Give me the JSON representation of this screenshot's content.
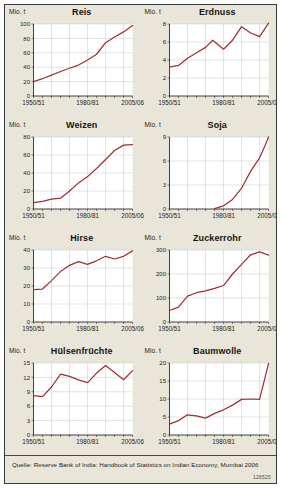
{
  "poster": {
    "unit_label": "Mio. t",
    "source": "Quelle: Reserve Bank of India: Handbook of Statistics on Indian Economy, Mumbai 2006",
    "source_code": "126525",
    "line_color": "#9e2f2f",
    "grid_color": "#b8bfc6",
    "axis_color": "#2b2b28",
    "background_color": "#e9e6d9"
  },
  "chart_data": [
    {
      "type": "line",
      "title": "Reis",
      "ylabel": "Mio. t",
      "xlabel": "",
      "xlim": [
        1950,
        2005
      ],
      "ylim": [
        0,
        100
      ],
      "yticks": [
        0,
        20,
        40,
        60,
        80,
        100
      ],
      "xticks": [
        1950,
        1980,
        2005
      ],
      "xticklabels": [
        "1950/51",
        "1980/81",
        "2005/06"
      ],
      "grid": true,
      "x": [
        1950,
        1955,
        1960,
        1965,
        1970,
        1975,
        1980,
        1985,
        1990,
        1995,
        2000,
        2005
      ],
      "values": [
        20.0,
        24.0,
        29.0,
        34.0,
        38.5,
        43.0,
        50.0,
        58.0,
        74.0,
        82.0,
        89.0,
        98.0
      ]
    },
    {
      "type": "line",
      "title": "Erdnuss",
      "ylabel": "Mio. t",
      "xlabel": "",
      "xlim": [
        1950,
        2005
      ],
      "ylim": [
        0,
        8
      ],
      "yticks": [
        0,
        2,
        4,
        6,
        8
      ],
      "xticks": [
        1950,
        1980,
        2005
      ],
      "xticklabels": [
        "1950/51",
        "1980/81",
        "2005/06"
      ],
      "grid": true,
      "x": [
        1950,
        1955,
        1960,
        1965,
        1970,
        1974,
        1980,
        1985,
        1990,
        1995,
        2000,
        2005
      ],
      "values": [
        3.2,
        3.4,
        4.2,
        4.8,
        5.4,
        6.2,
        5.2,
        6.2,
        7.7,
        7.0,
        6.6,
        8.1
      ]
    },
    {
      "type": "line",
      "title": "Weizen",
      "ylabel": "Mio. t",
      "xlabel": "",
      "xlim": [
        1950,
        2005
      ],
      "ylim": [
        0,
        80
      ],
      "yticks": [
        0,
        20,
        40,
        60,
        80
      ],
      "xticks": [
        1950,
        1980,
        2005
      ],
      "xticklabels": [
        "1950/51",
        "1980/81",
        "2005/06"
      ],
      "grid": true,
      "x": [
        1950,
        1955,
        1960,
        1965,
        1970,
        1975,
        1980,
        1985,
        1990,
        1995,
        2000,
        2005
      ],
      "values": [
        7.0,
        8.5,
        11.0,
        12.0,
        20.0,
        29.0,
        36.0,
        45.0,
        55.0,
        65.0,
        71.0,
        71.5
      ]
    },
    {
      "type": "line",
      "title": "Soja",
      "ylabel": "Mio. t",
      "xlabel": "",
      "xlim": [
        1950,
        2005
      ],
      "ylim": [
        0,
        9
      ],
      "yticks": [
        0,
        3,
        6,
        9
      ],
      "xticks": [
        1950,
        1980,
        2005
      ],
      "xticklabels": [
        "1950/51",
        "1980/81",
        "2005/06"
      ],
      "grid": true,
      "x": [
        1975,
        1980,
        1985,
        1990,
        1995,
        2000,
        2003,
        2005
      ],
      "values": [
        0.05,
        0.4,
        1.2,
        2.6,
        4.7,
        6.4,
        7.9,
        9.0
      ]
    },
    {
      "type": "line",
      "title": "Hirse",
      "ylabel": "Mio. t",
      "xlabel": "",
      "xlim": [
        1950,
        2005
      ],
      "ylim": [
        0,
        40
      ],
      "yticks": [
        0,
        10,
        20,
        30,
        40
      ],
      "xticks": [
        1950,
        1980,
        2005
      ],
      "xticklabels": [
        "1950/51",
        "1980/81",
        "2005/06"
      ],
      "grid": true,
      "x": [
        1950,
        1955,
        1960,
        1965,
        1970,
        1975,
        1980,
        1985,
        1990,
        1995,
        2000,
        2005
      ],
      "values": [
        18.0,
        18.3,
        23.0,
        28.0,
        31.5,
        33.5,
        32.0,
        34.0,
        36.5,
        35.0,
        36.5,
        39.5
      ]
    },
    {
      "type": "line",
      "title": "Zuckerrohr",
      "ylabel": "Mio. t",
      "xlabel": "",
      "xlim": [
        1950,
        2005
      ],
      "ylim": [
        0,
        300
      ],
      "yticks": [
        0,
        100,
        200,
        300
      ],
      "xticks": [
        1950,
        1980,
        2005
      ],
      "xticklabels": [
        "1950/51",
        "1980/81",
        "2005/06"
      ],
      "grid": true,
      "x": [
        1950,
        1955,
        1960,
        1965,
        1970,
        1975,
        1980,
        1985,
        1990,
        1995,
        2000,
        2005
      ],
      "values": [
        48.0,
        62.0,
        108.0,
        122.0,
        130.0,
        140.0,
        152.0,
        200.0,
        240.0,
        280.0,
        292.0,
        279.0
      ]
    },
    {
      "type": "line",
      "title": "Hülsenfrüchte",
      "ylabel": "Mio. t",
      "xlabel": "",
      "xlim": [
        1950,
        2005
      ],
      "ylim": [
        0,
        15
      ],
      "yticks": [
        0,
        3,
        6,
        9,
        12,
        15
      ],
      "xticks": [
        1950,
        1980,
        2005
      ],
      "xticklabels": [
        "1950/51",
        "1980/81",
        "2005/06"
      ],
      "grid": true,
      "x": [
        1950,
        1955,
        1960,
        1965,
        1970,
        1975,
        1980,
        1985,
        1990,
        1995,
        2000,
        2005
      ],
      "values": [
        8.2,
        8.0,
        10.0,
        12.7,
        12.2,
        11.5,
        10.9,
        12.9,
        14.5,
        13.0,
        11.5,
        13.4
      ]
    },
    {
      "type": "line",
      "title": "Baumwolle",
      "ylabel": "Mio. t",
      "xlabel": "",
      "xlim": [
        1950,
        2005
      ],
      "ylim": [
        0,
        20
      ],
      "yticks": [
        0,
        5,
        10,
        15,
        20
      ],
      "xticks": [
        1950,
        1980,
        2005
      ],
      "xticklabels": [
        "1950/51",
        "1980/81",
        "2005/06"
      ],
      "grid": true,
      "x": [
        1950,
        1955,
        1960,
        1965,
        1970,
        1975,
        1980,
        1985,
        1990,
        1995,
        2000,
        2005
      ],
      "values": [
        3.0,
        4.0,
        5.6,
        5.3,
        4.7,
        6.0,
        7.0,
        8.3,
        9.9,
        10.0,
        9.9,
        19.9
      ]
    }
  ]
}
